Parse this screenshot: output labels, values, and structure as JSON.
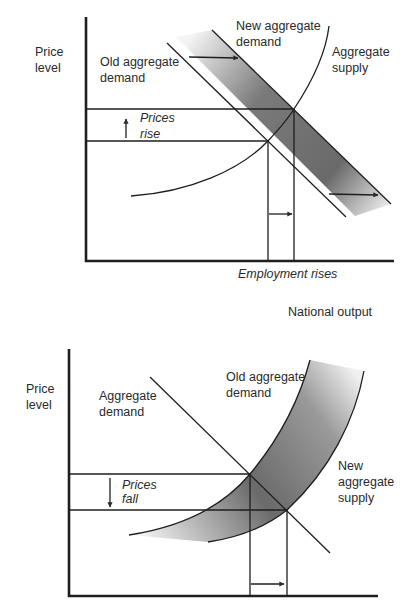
{
  "colors": {
    "ink": "#1e1e1e",
    "band_dark": "#5a5a5a",
    "band_light": "#f2f2f2",
    "background": "#ffffff"
  },
  "top_chart": {
    "y_axis_label_line1": "Price",
    "y_axis_label_line2": "level",
    "old_ad_label_line1": "Old aggregate",
    "old_ad_label_line2": "demand",
    "new_ad_label_line1": "New aggregate",
    "new_ad_label_line2": "demand",
    "as_label_line1": "Aggregate",
    "as_label_line2": "supply",
    "price_change_line1": "Prices",
    "price_change_line2": "rise",
    "employment_label": "Employment rises",
    "x_axis_label": "National output"
  },
  "bottom_chart": {
    "y_axis_label_line1": "Price",
    "y_axis_label_line2": "level",
    "ad_label_line1": "Aggregate",
    "ad_label_line2": "demand",
    "old_curve_label_line1": "Old aggregate",
    "old_curve_label_line2": "demand",
    "new_as_label_line1": "New",
    "new_as_label_line2": "aggregate",
    "new_as_label_line3": "supply",
    "price_change_line1": "Prices",
    "price_change_line2": "fall"
  }
}
